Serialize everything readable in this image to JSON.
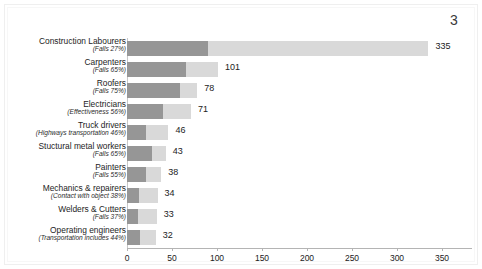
{
  "page": {
    "number": "3"
  },
  "chart_data": {
    "type": "bar",
    "orientation": "horizontal",
    "stacked": true,
    "title": "",
    "subtitle": "",
    "xlabel": "",
    "ylabel": "",
    "xlim": [
      0,
      383
    ],
    "xticks": [
      0,
      50,
      100,
      150,
      200,
      250,
      300,
      350
    ],
    "xtick_labels": [
      "0",
      "50",
      "100",
      "150",
      "200",
      "250",
      "300",
      "350"
    ],
    "grid": false,
    "legend": "none",
    "colors": {
      "segment_primary": "#969696",
      "segment_secondary": "#d9d9d9",
      "axis": "#b4b4b4",
      "text": "#1d1d1d"
    },
    "categories": [
      "Construction Labourers",
      "Carpenters",
      "Roofers",
      "Electricians",
      "Truck drivers",
      "Stuctural metal workers",
      "Painters",
      "Mechanics & repairers",
      "Welders & Cutters",
      "Operating engineers"
    ],
    "sublabels": [
      "(Falls 27%)",
      "(Falls 65%)",
      "(Falls 75%)",
      "(Effectiveness 56%)",
      "(Highways transportation 46%)",
      "(Falls 65%)",
      "(Falls 55%)",
      "(Contact with object 38%)",
      "(Falls 37%)",
      "(Transportation includes 44%)"
    ],
    "values": [
      335,
      101,
      78,
      71,
      46,
      43,
      38,
      34,
      33,
      32
    ],
    "value_labels": [
      "335",
      "101",
      "78",
      "71",
      "46",
      "43",
      "38",
      "34",
      "33",
      "32"
    ],
    "percentages": [
      27,
      65,
      75,
      56,
      46,
      65,
      55,
      38,
      37,
      44
    ],
    "series": [
      {
        "name": "Leading cause share",
        "values": [
          90.45,
          65.65,
          58.5,
          39.76,
          21.16,
          27.95,
          20.9,
          12.92,
          12.21,
          14.08
        ]
      },
      {
        "name": "Other causes",
        "values": [
          244.55,
          35.35,
          19.5,
          31.24,
          24.84,
          15.05,
          17.1,
          21.08,
          20.79,
          17.92
        ]
      }
    ],
    "rows": [
      {
        "name": "Construction Labourers",
        "sub": "(Falls 27%)",
        "total": 335,
        "label": "335",
        "pct": 27
      },
      {
        "name": "Carpenters",
        "sub": "(Falls 65%)",
        "total": 101,
        "label": "101",
        "pct": 65
      },
      {
        "name": "Roofers",
        "sub": "(Falls 75%)",
        "total": 78,
        "label": "78",
        "pct": 75
      },
      {
        "name": "Electricians",
        "sub": "(Effectiveness 56%)",
        "total": 71,
        "label": "71",
        "pct": 56
      },
      {
        "name": "Truck drivers",
        "sub": "(Highways transportation 46%)",
        "total": 46,
        "label": "46",
        "pct": 46
      },
      {
        "name": "Stuctural metal workers",
        "sub": "(Falls 65%)",
        "total": 43,
        "label": "43",
        "pct": 65
      },
      {
        "name": "Painters",
        "sub": "(Falls 55%)",
        "total": 38,
        "label": "38",
        "pct": 55
      },
      {
        "name": "Mechanics & repairers",
        "sub": "(Contact with object 38%)",
        "total": 34,
        "label": "34",
        "pct": 38
      },
      {
        "name": "Welders & Cutters",
        "sub": "(Falls 37%)",
        "total": 33,
        "label": "33",
        "pct": 37
      },
      {
        "name": "Operating engineers",
        "sub": "(Transportation includes 44%)",
        "total": 32,
        "label": "32",
        "pct": 44
      }
    ]
  }
}
